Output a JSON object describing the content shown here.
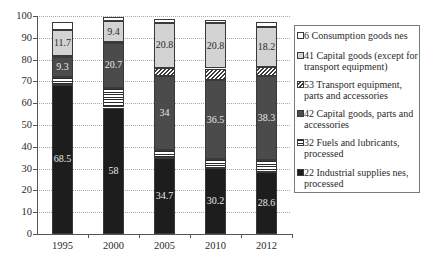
{
  "chart_data": {
    "type": "bar",
    "stacked": true,
    "title": "",
    "xlabel": "",
    "ylabel": "",
    "ylim": [
      0,
      100
    ],
    "grid": true,
    "legend_position": "right",
    "categories": [
      "1995",
      "2000",
      "2005",
      "2010",
      "2012"
    ],
    "y_ticks": [
      "0",
      "10",
      "20",
      "30",
      "40",
      "50",
      "60",
      "70",
      "80",
      "90",
      "100"
    ],
    "series": [
      {
        "key": "industrial",
        "name": "22 Industrial supplies nes, processed",
        "color": "#1d1d1d",
        "pattern": "solid",
        "values": [
          68.5,
          58,
          34.7,
          30.2,
          28.6
        ],
        "labels": [
          "68.5",
          "58",
          "34.7",
          "30.2",
          "28.6"
        ],
        "label_tone": "dark"
      },
      {
        "key": "fuels",
        "name": "32 Fuels and lubricants, processed",
        "color": "#ffffff",
        "pattern": "horizontal-stripes",
        "values": [
          3.5,
          9.0,
          3.9,
          4.0,
          5.5
        ],
        "labels": null
      },
      {
        "key": "capital_parts",
        "name": "42 Capital goods, parts and accessories",
        "color": "#4b4b4b",
        "pattern": "solid",
        "values": [
          9.3,
          20.7,
          34,
          36.5,
          38.3
        ],
        "labels": [
          "9.3",
          "20.7",
          "34",
          "36.5",
          "38.3"
        ],
        "label_tone": "dark"
      },
      {
        "key": "transport",
        "name": "53 Transport equipment, parts and accessories",
        "color": "#ffffff",
        "pattern": "diagonal-hatch",
        "values": [
          0.4,
          0.4,
          3.5,
          5.2,
          4.2
        ],
        "labels": null
      },
      {
        "key": "capital_except",
        "name": "41 Capital goods (except for transport equipment)",
        "color": "#d3d3d3",
        "pattern": "solid",
        "values": [
          11.7,
          9.4,
          20.8,
          20.8,
          18.2
        ],
        "labels": [
          "11.7",
          "9.4",
          "20.8",
          "20.8",
          "18.2"
        ],
        "label_tone": "light"
      },
      {
        "key": "consumption",
        "name": "6 Consumption goods nes",
        "color": "#ffffff",
        "pattern": "solid",
        "values": [
          4.0,
          1.9,
          1.8,
          1.5,
          2.6
        ],
        "labels": null
      }
    ],
    "legend": [
      {
        "key": "consumption",
        "lines": [
          "6 Consumption goods nes"
        ]
      },
      {
        "key": "capital_except",
        "lines": [
          "41 Capital goods (except for",
          "transport equipment)"
        ]
      },
      {
        "key": "transport",
        "lines": [
          "53 Transport equipment,",
          "parts and accessories"
        ]
      },
      {
        "key": "capital_parts",
        "lines": [
          "42 Capital goods, parts and",
          "accessories"
        ]
      },
      {
        "key": "fuels",
        "lines": [
          "32 Fuels and lubricants,",
          "processed"
        ]
      },
      {
        "key": "industrial",
        "lines": [
          "22 Industrial supplies nes,",
          "processed"
        ]
      }
    ]
  }
}
